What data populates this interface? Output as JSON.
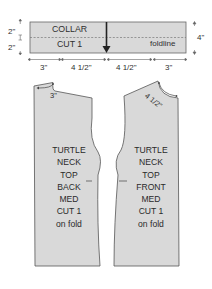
{
  "colors": {
    "fill": "#d9d9d9",
    "stroke": "#555555",
    "text": "#2f2f2f",
    "background": "#ffffff"
  },
  "collar": {
    "title": "COLLAR",
    "cut": "CUT 1",
    "foldline_label": "foldline",
    "height_top": "2\"",
    "height_bottom": "2\"",
    "height_total": "4\"",
    "widths": [
      "3\"",
      "4 1/2\"",
      "4 1/2\"",
      "3\""
    ]
  },
  "back_piece": {
    "neck_measure": "3\"",
    "lines": [
      "TURTLE",
      "NECK",
      "TOP",
      "BACK",
      "MED",
      "CUT 1",
      "on fold"
    ]
  },
  "front_piece": {
    "neck_measure": "4 1/2\"",
    "lines": [
      "TURTLE",
      "NECK",
      "TOP",
      "FRONT",
      "MED",
      "CUT 1",
      "on fold"
    ]
  }
}
